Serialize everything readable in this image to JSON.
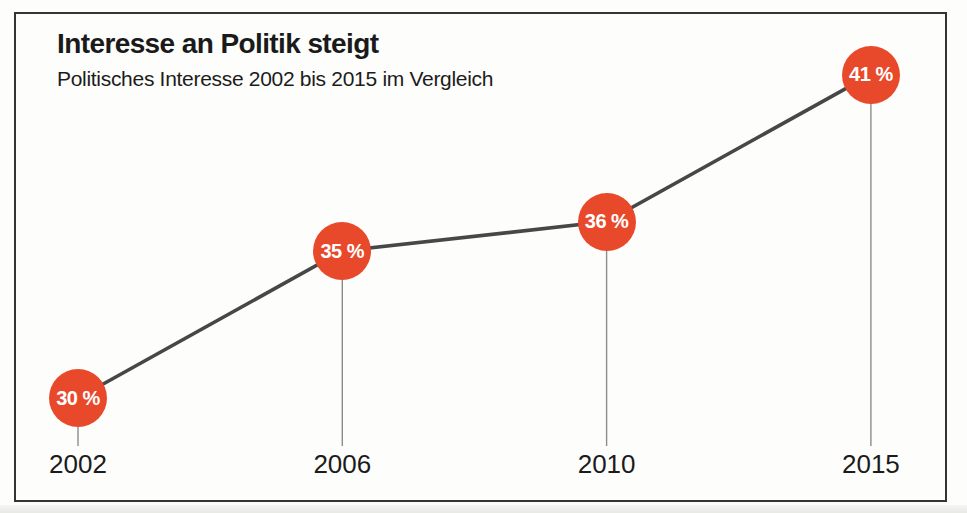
{
  "chart": {
    "title": "Interesse an Politik steigt",
    "subtitle": "Politisches Interesse 2002 bis 2015 im Vergleich"
  },
  "chart_data": {
    "type": "line",
    "title": "Interesse an Politik steigt",
    "subtitle": "Politisches Interesse 2002 bis 2015 im Vergleich",
    "categories": [
      "2002",
      "2006",
      "2010",
      "2015"
    ],
    "values": [
      30,
      35,
      36,
      41
    ],
    "point_labels": [
      "30 %",
      "35 %",
      "36 %",
      "41 %"
    ],
    "unit": "%",
    "xlabel": "",
    "ylabel": "",
    "ylim": [
      28,
      43
    ],
    "grid": false,
    "legend": "none",
    "colors": {
      "marker": "#E8492B",
      "line": "#474747",
      "stem": "#8C8C8C",
      "marker_text": "#FFFFFF",
      "frame_border": "#343434",
      "text": "#1A1A1A"
    }
  }
}
